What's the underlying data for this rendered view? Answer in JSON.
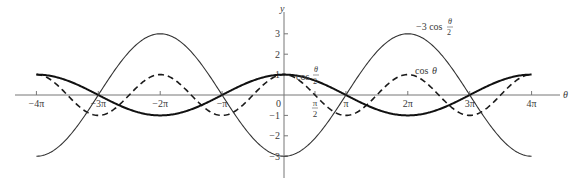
{
  "chart_data": {
    "type": "line",
    "title": "",
    "xlabel": "θ",
    "ylabel": "y",
    "xlim": [
      -12.566,
      12.566
    ],
    "ylim": [
      -3,
      3
    ],
    "grid": false,
    "legend": "inline labels",
    "x_ticks": [
      {
        "value": -12.566,
        "label": "−4π"
      },
      {
        "value": -9.425,
        "label": "−3π"
      },
      {
        "value": -6.283,
        "label": "−2π"
      },
      {
        "value": -3.142,
        "label": "−π"
      },
      {
        "value": 0,
        "label": ""
      },
      {
        "value": 1.571,
        "label": "π/2"
      },
      {
        "value": 3.142,
        "label": "π"
      },
      {
        "value": 6.283,
        "label": "2π"
      },
      {
        "value": 9.425,
        "label": "3π"
      },
      {
        "value": 12.566,
        "label": "4π"
      }
    ],
    "y_ticks": [
      {
        "value": 3,
        "label": "3"
      },
      {
        "value": 2,
        "label": "2"
      },
      {
        "value": 1,
        "label": "1"
      },
      {
        "value": 0,
        "label": "0"
      },
      {
        "value": -1,
        "label": "−1"
      },
      {
        "value": -2,
        "label": "−2"
      },
      {
        "value": -3,
        "label": "−3"
      }
    ],
    "series": [
      {
        "name": "cos θ",
        "expr": "cos(t)",
        "style": "dashed",
        "label": "cos θ"
      },
      {
        "name": "cos θ/2",
        "expr": "cos(t/2)",
        "style": "thick solid",
        "label": "cos θ/2"
      },
      {
        "name": "−3 cos θ/2",
        "expr": "-3*cos(t/2)",
        "style": "thin solid",
        "label": "−3 cos θ/2"
      }
    ],
    "annotations": [
      {
        "text": "−3 cos θ/2",
        "near_x": 6.283,
        "near_y": 3
      },
      {
        "text": "cos θ",
        "near_x": 6.283,
        "near_y": 1
      },
      {
        "text": "cos θ/2",
        "near_x": 0.5,
        "near_y": 1
      }
    ]
  }
}
